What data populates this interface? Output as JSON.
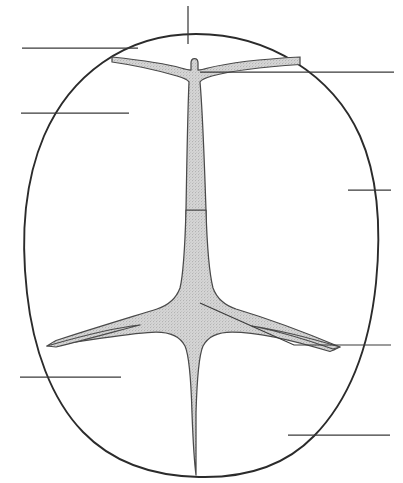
{
  "figure": {
    "background_color": "#ffffff",
    "outline_color": "#2b2b2b",
    "structure_fill_color": "#d2d2d2",
    "structure_stroke_color": "#4a4a4a",
    "leader_line_color": "#3a3a3a"
  },
  "outline": {
    "name": "sectional-outline",
    "shape": "oval",
    "bounds": {
      "left": 24,
      "top": 34,
      "right": 381,
      "bottom": 477
    },
    "center_x": 202,
    "center_y": 256,
    "radius_x": 178,
    "radius_y": 221
  },
  "structure": {
    "name": "internal-branching-structure",
    "fill": "stippled-gray",
    "parts": [
      {
        "name": "upper-crossbar",
        "orientation": "horizontal",
        "y": 62,
        "x_start": 112,
        "x_end": 300,
        "description": "thin tapering horizontal band near the apex"
      },
      {
        "name": "vertical-stem",
        "orientation": "vertical",
        "x": 194,
        "y_start": 64,
        "y_end": 475,
        "description": "central column widening toward the mid junction"
      },
      {
        "name": "central-junction",
        "shape": "four-armed-star",
        "center_x": 196,
        "center_y": 310,
        "description": "four concave tapering arms meeting at the core"
      },
      {
        "name": "left-lower-arm",
        "direction": "left",
        "tip_x": 47,
        "tip_y": 346
      },
      {
        "name": "right-lower-arm",
        "direction": "right",
        "tip_x": 340,
        "tip_y": 347
      },
      {
        "name": "lower-stem-tip",
        "direction": "down",
        "tip_x": 196,
        "tip_y": 475
      }
    ]
  },
  "leader_lines": [
    {
      "id": "leader-top-apex",
      "orientation": "vertical",
      "label": "",
      "x1": 188,
      "y1": 6,
      "x2": 188,
      "y2": 44,
      "anchor_side": "top"
    },
    {
      "id": "leader-upper-left-outer",
      "orientation": "horizontal",
      "label": "",
      "x1": 22,
      "y1": 48,
      "x2": 138,
      "y2": 48,
      "anchor_side": "left"
    },
    {
      "id": "leader-upper-right",
      "orientation": "horizontal",
      "label": "",
      "x1": 200,
      "y1": 72,
      "x2": 394,
      "y2": 72,
      "anchor_side": "right"
    },
    {
      "id": "leader-mid-left",
      "orientation": "horizontal",
      "label": "",
      "x1": 21,
      "y1": 113,
      "x2": 129,
      "y2": 113,
      "anchor_side": "left"
    },
    {
      "id": "leader-mid-right",
      "orientation": "horizontal",
      "label": "",
      "x1": 348,
      "y1": 190,
      "x2": 391,
      "y2": 190,
      "anchor_side": "right"
    },
    {
      "id": "leader-lower-right-angled",
      "orientation": "angled-then-horizontal",
      "label": "",
      "x1": 200,
      "y1": 303,
      "x2": 294,
      "y2": 345,
      "x3": 391,
      "y3": 345,
      "anchor_side": "right"
    },
    {
      "id": "leader-lower-left",
      "orientation": "horizontal",
      "label": "",
      "x1": 20,
      "y1": 377,
      "x2": 121,
      "y2": 377,
      "anchor_side": "left"
    },
    {
      "id": "leader-bottom-right",
      "orientation": "horizontal",
      "label": "",
      "x1": 288,
      "y1": 435,
      "x2": 390,
      "y2": 435,
      "anchor_side": "right"
    }
  ]
}
